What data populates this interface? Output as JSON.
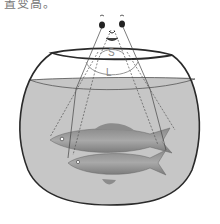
{
  "caption": "置变高。",
  "diagram": {
    "labels": {
      "small_angle": "S",
      "large_angle": "L"
    },
    "colors": {
      "water": "#c4c4c4",
      "bowl_outline": "#2a2a2a",
      "ray_lines": "#444444",
      "label_gray": "#888888"
    },
    "elements": [
      "observer-face",
      "fishbowl",
      "water",
      "real-fish",
      "apparent-fish",
      "sight-lines",
      "angle-arc"
    ]
  }
}
